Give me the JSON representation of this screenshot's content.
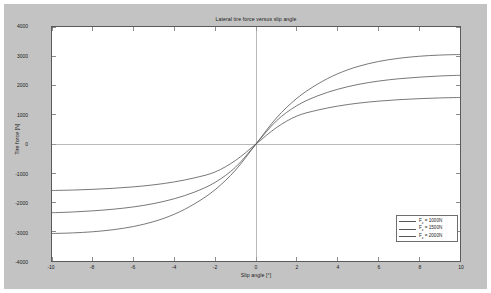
{
  "chart_data": {
    "type": "line",
    "title": "Lateral tire force versus slip angle",
    "xlabel": "Slip angle [°]",
    "ylabel": "Tire force [N]",
    "xlim": [
      -10,
      10
    ],
    "ylim": [
      -4000,
      4000
    ],
    "xticks": [
      -10,
      -8,
      -6,
      -4,
      -2,
      0,
      2,
      4,
      6,
      8,
      10
    ],
    "yticks": [
      -4000,
      -3000,
      -2000,
      -1000,
      0,
      1000,
      2000,
      3000,
      4000
    ],
    "xtick_labels": [
      "-10",
      "-8",
      "-6",
      "-4",
      "-2",
      "0",
      "2",
      "4",
      "6",
      "8",
      "10"
    ],
    "ytick_labels": [
      "-4000",
      "-3000",
      "-2000",
      "-1000",
      "0",
      "1000",
      "2000",
      "3000",
      "4000"
    ],
    "grid": false,
    "legend_position": "lower right",
    "x": [
      -10,
      -9,
      -8,
      -7,
      -6,
      -5,
      -4,
      -3,
      -2,
      -1,
      0,
      1,
      2,
      3,
      4,
      5,
      6,
      7,
      8,
      9,
      10
    ],
    "series": [
      {
        "name": "Fz = 1000N",
        "label_base": "F",
        "label_sub": "z",
        "label_rest": " = 1000N",
        "color": "#555555",
        "values": [
          -1590,
          -1575,
          -1550,
          -1515,
          -1465,
          -1395,
          -1295,
          -1155,
          -955,
          -560,
          0,
          560,
          955,
          1155,
          1295,
          1395,
          1465,
          1515,
          1550,
          1575,
          1590
        ]
      },
      {
        "name": "Fz = 1500N",
        "label_base": "F",
        "label_sub": "z",
        "label_rest": " = 1500N",
        "color": "#555555",
        "values": [
          -2350,
          -2325,
          -2285,
          -2230,
          -2150,
          -2035,
          -1870,
          -1640,
          -1310,
          -790,
          0,
          790,
          1310,
          1640,
          1870,
          2035,
          2150,
          2230,
          2285,
          2325,
          2350
        ]
      },
      {
        "name": "Fz = 2000N",
        "label_base": "F",
        "label_sub": "z",
        "label_rest": " = 2000N",
        "color": "#555555",
        "values": [
          -3060,
          -3040,
          -3000,
          -2930,
          -2820,
          -2650,
          -2400,
          -2040,
          -1560,
          -890,
          0,
          890,
          1560,
          2040,
          2400,
          2650,
          2820,
          2930,
          3000,
          3040,
          3060
        ]
      }
    ],
    "axis_line_color": "#9a9a9a",
    "frame_color": "#5a5a5a"
  },
  "figure": {
    "background_color": "#c3c3c3",
    "plot_background_color": "#ffffff"
  }
}
